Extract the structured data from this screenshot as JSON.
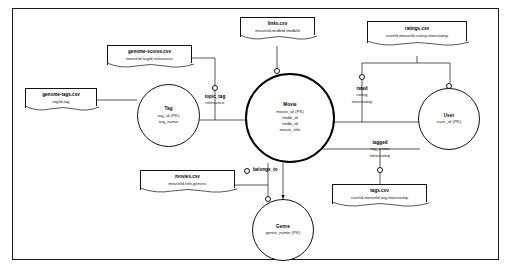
{
  "diagram": {
    "entities": [
      {
        "id": "tag",
        "name": "Tag",
        "attrs": [
          "tag_id (PK)",
          "tag_name"
        ]
      },
      {
        "id": "movie",
        "name": "Movie",
        "attrs": [
          "movie_id (PK)",
          "tmdb_id",
          "imdb_id",
          "movie_title"
        ]
      },
      {
        "id": "user",
        "name": "User",
        "attrs": [
          "user_id (PK)"
        ]
      },
      {
        "id": "genre",
        "name": "Genre",
        "attrs": [
          "genre_name (PK)"
        ]
      }
    ],
    "relationships": [
      {
        "id": "topic_tag",
        "name": "topic_tag",
        "attrs": [
          "relevance"
        ]
      },
      {
        "id": "rated",
        "name": "rated",
        "attrs": [
          "rating",
          "timestamp"
        ]
      },
      {
        "id": "tagged",
        "name": "tagged",
        "attrs": [
          "tag_name",
          "timestamp"
        ]
      },
      {
        "id": "belongs_to",
        "name": "belongs_to",
        "attrs": []
      }
    ],
    "notes": [
      {
        "id": "genome-scores",
        "title": "genome-scores.csv",
        "columns": "movieId,tagId,relevance"
      },
      {
        "id": "genome-tags",
        "title": "genome-tags.csv",
        "columns": "tagId,tag"
      },
      {
        "id": "links",
        "title": "links.csv",
        "columns": "movieId,imdbId,tmdbId"
      },
      {
        "id": "ratings",
        "title": "ratings.csv",
        "columns": "userId,movieId,rating,timestamp"
      },
      {
        "id": "movies",
        "title": "movies.csv",
        "columns": "movieId,title,genres"
      },
      {
        "id": "tags",
        "title": "tags.csv",
        "columns": "userId,movieId,tag,timestamp"
      }
    ],
    "colors": {
      "line": "#111111",
      "text": "#111111",
      "background": "#ffffff",
      "emphasis": "#000000"
    }
  }
}
